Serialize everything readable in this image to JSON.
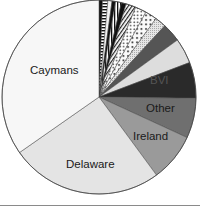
{
  "chart_data": {
    "type": "pie",
    "title": "",
    "start_angle_deg": 0,
    "direction": "clockwise",
    "legend": "none",
    "slices": [
      {
        "label": "",
        "value": 0.6,
        "fill": "#111111",
        "pattern": "solid"
      },
      {
        "label": "",
        "value": 0.9,
        "fill": "#ffffff",
        "pattern": "hstripes"
      },
      {
        "label": "",
        "value": 0.7,
        "fill": "#f2f2f2",
        "pattern": "solid"
      },
      {
        "label": "",
        "value": 0.6,
        "fill": "#111111",
        "pattern": "solid"
      },
      {
        "label": "",
        "value": 1.0,
        "fill": "#ffffff",
        "pattern": "vstripes"
      },
      {
        "label": "",
        "value": 0.8,
        "fill": "#111111",
        "pattern": "solid"
      },
      {
        "label": "",
        "value": 1.7,
        "fill": "#ffffff",
        "pattern": "diag"
      },
      {
        "label": "",
        "value": 1.9,
        "fill": "#ffffff",
        "pattern": "dots"
      },
      {
        "label": "",
        "value": 2.0,
        "fill": "#ffffff",
        "pattern": "dots2"
      },
      {
        "label": "",
        "value": 1.9,
        "fill": "#dcdcdc",
        "pattern": "fine"
      },
      {
        "label": "",
        "value": 3.2,
        "fill": "#555555",
        "pattern": "solid"
      },
      {
        "label": "",
        "value": 4.3,
        "fill": "#dddddd",
        "pattern": "solid"
      },
      {
        "label": "BVI",
        "value": 6.1,
        "fill": "#2a2a2a",
        "pattern": "solid"
      },
      {
        "label": "Other",
        "value": 6.8,
        "fill": "#6f6f6f",
        "pattern": "solid"
      },
      {
        "label": "Ireland",
        "value": 8.2,
        "fill": "#9a9a9a",
        "pattern": "solid"
      },
      {
        "label": "Delaware",
        "value": 25.9,
        "fill": "#e4e4e4",
        "pattern": "solid"
      },
      {
        "label": "Caymans",
        "value": 35.4,
        "fill": "#f7f7f7",
        "pattern": "solid"
      }
    ],
    "labels": {
      "caymans": "Caymans",
      "delaware": "Delaware",
      "ireland": "Ireland",
      "other": "Other",
      "bvi": "BVI"
    }
  }
}
